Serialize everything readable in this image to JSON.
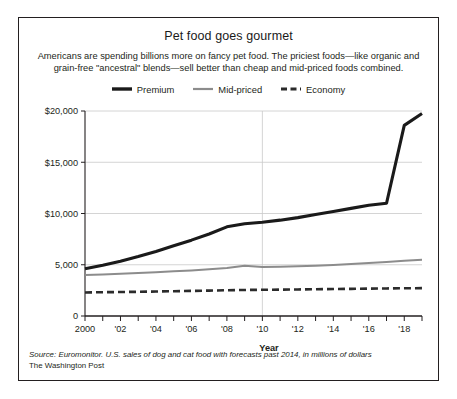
{
  "chart_data": {
    "type": "line",
    "title": "Pet food goes gourmet",
    "subtitle_line1": "Americans are spending billions more on fancy pet food. The priciest foods—like organic",
    "subtitle_line2": "and grain-free \"ancestral\" blends—sell better than cheap and mid-priced foods combined.",
    "xlabel": "Year",
    "ylabel": "",
    "xlim": [
      2000,
      2019
    ],
    "ylim": [
      0,
      20000
    ],
    "grid": true,
    "legend_position": "top-center",
    "source_line1": "Source: Euromonitor. U.S. sales of dog and cat food with forecasts past 2014, in millions of dollars",
    "source_line2": "The Washington Post",
    "y_ticks": [
      {
        "value": 0,
        "label": "0"
      },
      {
        "value": 5000,
        "label": "5,000"
      },
      {
        "value": 10000,
        "label": "$10,000"
      },
      {
        "value": 15000,
        "label": "$15,000"
      },
      {
        "value": 20000,
        "label": "$20,000"
      }
    ],
    "x_ticks": [
      {
        "value": 2000,
        "label": "2000"
      },
      {
        "value": 2001,
        "label": ""
      },
      {
        "value": 2002,
        "label": "'02"
      },
      {
        "value": 2003,
        "label": ""
      },
      {
        "value": 2004,
        "label": "'04"
      },
      {
        "value": 2005,
        "label": ""
      },
      {
        "value": 2006,
        "label": "'06"
      },
      {
        "value": 2007,
        "label": ""
      },
      {
        "value": 2008,
        "label": "'08"
      },
      {
        "value": 2009,
        "label": ""
      },
      {
        "value": 2010,
        "label": "'10"
      },
      {
        "value": 2011,
        "label": ""
      },
      {
        "value": 2012,
        "label": "'12"
      },
      {
        "value": 2013,
        "label": ""
      },
      {
        "value": 2014,
        "label": "'14"
      },
      {
        "value": 2015,
        "label": ""
      },
      {
        "value": 2016,
        "label": "'16"
      },
      {
        "value": 2017,
        "label": ""
      },
      {
        "value": 2018,
        "label": "'18"
      },
      {
        "value": 2019,
        "label": ""
      }
    ],
    "x": [
      2000,
      2001,
      2002,
      2003,
      2004,
      2005,
      2006,
      2007,
      2008,
      2009,
      2010,
      2011,
      2012,
      2013,
      2014,
      2015,
      2016,
      2017,
      2018,
      2019
    ],
    "series": [
      {
        "name": "Premium",
        "color": "#1a1a1a",
        "style": "solid",
        "width": 3.1,
        "values": [
          4600,
          4950,
          5350,
          5800,
          6300,
          6850,
          7400,
          8000,
          8700,
          9000,
          9150,
          9350,
          9600,
          9900,
          10200,
          10500,
          10800,
          11000,
          18600,
          19750
        ]
      },
      {
        "name": "Mid-priced",
        "color": "#8c8c8c",
        "style": "solid",
        "width": 2.0,
        "values": [
          4000,
          4050,
          4120,
          4200,
          4280,
          4360,
          4450,
          4550,
          4680,
          4900,
          4780,
          4800,
          4850,
          4900,
          4980,
          5080,
          5180,
          5280,
          5400,
          5500
        ]
      },
      {
        "name": "Economy",
        "color": "#2b2b2b",
        "style": "dashed",
        "width": 2.6,
        "values": [
          2300,
          2320,
          2340,
          2360,
          2390,
          2420,
          2450,
          2480,
          2510,
          2540,
          2555,
          2570,
          2590,
          2610,
          2630,
          2650,
          2670,
          2690,
          2705,
          2720
        ]
      }
    ]
  }
}
